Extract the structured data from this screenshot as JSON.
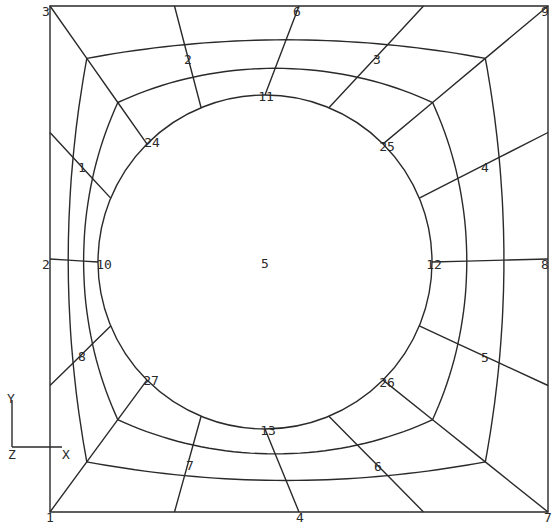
{
  "figure": {
    "type": "finite-element-mesh",
    "outer_square": {
      "left": 50,
      "top": 6,
      "right": 548,
      "bottom": 512
    },
    "hole": {
      "cx": 265,
      "cy": 262,
      "r": 167
    },
    "radial_divisions_per_side": 4,
    "ring_count": 3
  },
  "region_labels": [
    {
      "text": "1",
      "x": 82,
      "y": 172
    },
    {
      "text": "2",
      "x": 188,
      "y": 64
    },
    {
      "text": "3",
      "x": 377,
      "y": 64
    },
    {
      "text": "4",
      "x": 485,
      "y": 172
    },
    {
      "text": "5",
      "x": 485,
      "y": 362
    },
    {
      "text": "6",
      "x": 378,
      "y": 471
    },
    {
      "text": "7",
      "x": 190,
      "y": 470
    },
    {
      "text": "8",
      "x": 82,
      "y": 361
    },
    {
      "text": "5",
      "x": 265,
      "y": 268
    }
  ],
  "node_labels": [
    {
      "text": "3",
      "x": 46,
      "y": 16
    },
    {
      "text": "6",
      "x": 297,
      "y": 16
    },
    {
      "text": "9",
      "x": 545,
      "y": 16
    },
    {
      "text": "2",
      "x": 46,
      "y": 269
    },
    {
      "text": "8",
      "x": 545,
      "y": 269
    },
    {
      "text": "1",
      "x": 50,
      "y": 522
    },
    {
      "text": "4",
      "x": 300,
      "y": 522
    },
    {
      "text": "7",
      "x": 548,
      "y": 522
    },
    {
      "text": "10",
      "x": 104,
      "y": 269
    },
    {
      "text": "11",
      "x": 266,
      "y": 101
    },
    {
      "text": "12",
      "x": 434,
      "y": 269
    },
    {
      "text": "13",
      "x": 268,
      "y": 435
    },
    {
      "text": "24",
      "x": 152,
      "y": 147
    },
    {
      "text": "25",
      "x": 387,
      "y": 151
    },
    {
      "text": "26",
      "x": 387,
      "y": 387
    },
    {
      "text": "27",
      "x": 151,
      "y": 385
    }
  ],
  "axis_triad": {
    "origin": {
      "x": 12,
      "y": 447
    },
    "y_label": "Y",
    "x_label": "X",
    "z_label": "Z"
  },
  "colors": {
    "line": "#2a2a2a",
    "background": "#ffffff"
  }
}
